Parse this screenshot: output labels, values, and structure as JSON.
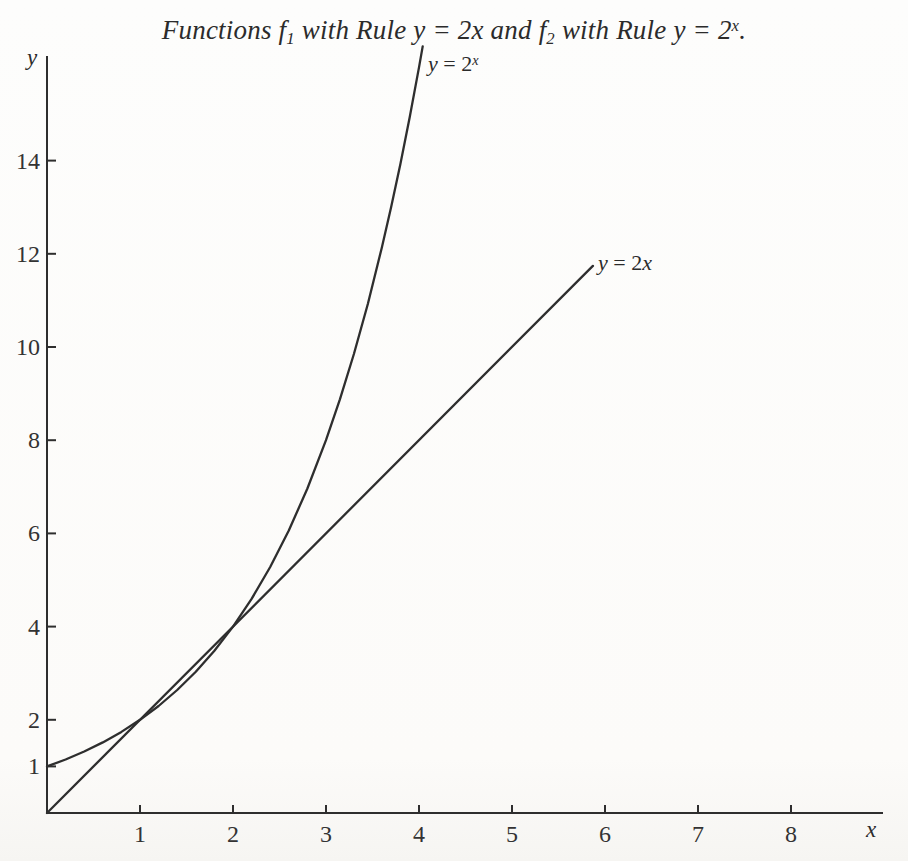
{
  "figure": {
    "title_full": "Functions f1 with Rule y = 2x and f2 with Rule y = 2^x.",
    "title_parts": [
      {
        "t": "Functions f"
      },
      {
        "t": "1",
        "pos": "sub"
      },
      {
        "t": " with Rule y = 2x and f"
      },
      {
        "t": "2",
        "pos": "sub"
      },
      {
        "t": " with Rule y = 2"
      },
      {
        "t": "x",
        "pos": "sup"
      },
      {
        "t": "."
      }
    ]
  },
  "colors": {
    "paper": "#fdfdfc",
    "ink": "#2e2e2e"
  },
  "chart_data": {
    "type": "line",
    "xlabel": "x",
    "ylabel": "y",
    "xlim": [
      0,
      9
    ],
    "ylim": [
      0,
      16.3
    ],
    "grid": false,
    "legend_position": "inline-labels",
    "x_ticks": [
      1,
      2,
      3,
      4,
      5,
      6,
      7,
      8
    ],
    "y_ticks": [
      1,
      2,
      4,
      6,
      8,
      10,
      12,
      14
    ],
    "series": [
      {
        "name": "f1",
        "rule": "y = 2x",
        "label_parts": [
          {
            "t": "y",
            "it": true
          },
          {
            "t": " = 2"
          },
          {
            "t": "x",
            "it": true
          }
        ],
        "points": [
          [
            0,
            0
          ],
          [
            5.87,
            11.74
          ]
        ]
      },
      {
        "name": "f2",
        "rule": "y = 2^x",
        "label_parts": [
          {
            "t": "y",
            "it": true
          },
          {
            "t": " = 2"
          },
          {
            "t": "x",
            "it": true,
            "pos": "sup"
          }
        ],
        "points": [
          [
            0,
            1
          ],
          [
            0.2,
            1.149
          ],
          [
            0.4,
            1.32
          ],
          [
            0.6,
            1.516
          ],
          [
            0.8,
            1.741
          ],
          [
            1,
            2
          ],
          [
            1.2,
            2.297
          ],
          [
            1.4,
            2.639
          ],
          [
            1.6,
            3.031
          ],
          [
            1.8,
            3.482
          ],
          [
            2,
            4
          ],
          [
            2.2,
            4.595
          ],
          [
            2.4,
            5.278
          ],
          [
            2.6,
            6.063
          ],
          [
            2.8,
            6.964
          ],
          [
            3,
            8
          ],
          [
            3.15,
            8.877
          ],
          [
            3.3,
            9.849
          ],
          [
            3.45,
            10.93
          ],
          [
            3.6,
            12.13
          ],
          [
            3.7,
            13.0
          ],
          [
            3.8,
            13.93
          ],
          [
            3.9,
            14.93
          ],
          [
            4,
            16
          ],
          [
            4.04,
            16.45
          ]
        ]
      }
    ]
  }
}
